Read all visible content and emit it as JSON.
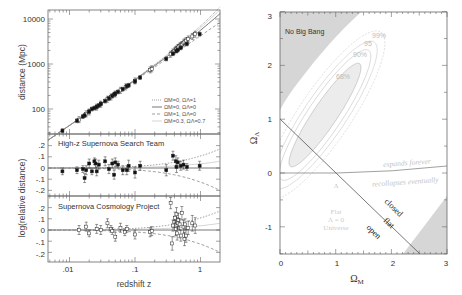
{
  "chart_data": [
    {
      "type": "scatter",
      "title": "Hubble diagram of Type Ia supernovae",
      "xlabel": "redshift z",
      "xscale": "log",
      "xlim": [
        0.0047,
        2.0
      ],
      "x_ticks": [
        ".01",
        ".1",
        "1"
      ],
      "panels": [
        {
          "name": "hubble",
          "ylabel": "distance (Mpc)",
          "yscale": "log",
          "ylim": [
            28,
            16000
          ],
          "y_ticks": [
            "100",
            "1000",
            "10000"
          ],
          "legend": [
            {
              "label": "ΩM=0, ΩΛ=1",
              "style": "dotted"
            },
            {
              "label": "ΩM=0, ΩΛ=0",
              "style": "solid"
            },
            {
              "label": "ΩM=1, ΩΛ=0",
              "style": "dashed"
            },
            {
              "label": "ΩM=0.3, ΩΛ=0.7",
              "style": "thin-solid"
            }
          ],
          "legend_position": "lower right",
          "series": [
            {
              "name": "High-z Supernova Search Team",
              "marker": "filled-square",
              "x": [
                0.0078,
                0.013,
                0.016,
                0.017,
                0.02,
                0.022,
                0.024,
                0.026,
                0.028,
                0.03,
                0.035,
                0.04,
                0.045,
                0.048,
                0.05,
                0.055,
                0.065,
                0.075,
                0.08,
                0.1,
                0.12,
                0.3,
                0.38,
                0.43,
                0.45,
                0.5,
                0.62,
                0.97
              ],
              "y": [
                33,
                55,
                68,
                72,
                88,
                100,
                105,
                112,
                120,
                130,
                150,
                172,
                195,
                210,
                220,
                240,
                275,
                320,
                335,
                410,
                500,
                1300,
                1700,
                1950,
                2050,
                2300,
                2800,
                4600
              ]
            },
            {
              "name": "Supernova Cosmology Project",
              "marker": "open-square",
              "x": [
                0.014,
                0.018,
                0.02,
                0.026,
                0.03,
                0.038,
                0.043,
                0.05,
                0.06,
                0.072,
                0.1,
                0.17,
                0.18,
                0.35,
                0.38,
                0.4,
                0.42,
                0.43,
                0.45,
                0.46,
                0.48,
                0.5,
                0.52,
                0.55,
                0.57,
                0.6,
                0.65,
                0.75,
                0.83
              ],
              "y": [
                58,
                78,
                86,
                110,
                128,
                165,
                185,
                215,
                260,
                310,
                420,
                740,
                780,
                1650,
                1850,
                1950,
                2100,
                2150,
                2300,
                2350,
                2500,
                2600,
                2700,
                2950,
                3100,
                3300,
                3600,
                4100,
                4600
              ]
            }
          ]
        },
        {
          "name": "residual-high-z",
          "panel_label": "High-z Supernova Search Team",
          "ylabel": "log(relative distance)",
          "ylim": [
            -0.25,
            0.25
          ],
          "y_ticks": [
            ".2",
            ".1",
            "0",
            "-.1",
            "-.2"
          ],
          "series": [
            {
              "name": "High-z Supernova Search Team",
              "marker": "filled-square",
              "x": [
                0.0078,
                0.013,
                0.016,
                0.017,
                0.018,
                0.02,
                0.022,
                0.024,
                0.025,
                0.026,
                0.028,
                0.035,
                0.04,
                0.045,
                0.048,
                0.05,
                0.055,
                0.065,
                0.075,
                0.08,
                0.1,
                0.12,
                0.3,
                0.38,
                0.42,
                0.43,
                0.45,
                0.5,
                0.55,
                0.62,
                0.97
              ],
              "y": [
                -0.03,
                -0.02,
                -0.01,
                -0.09,
                -0.02,
                0.04,
                -0.03,
                0.06,
                0.04,
                -0.03,
                0.03,
                0.06,
                -0.01,
                0.04,
                -0.06,
                0.05,
                0.03,
                -0.02,
                -0.02,
                0.02,
                -0.04,
                0.02,
                -0.02,
                0.11,
                0.06,
                0.01,
                0.05,
                0.02,
                0.03,
                0.01,
                0.02
              ],
              "err": [
                0.03,
                0.03,
                0.03,
                0.04,
                0.04,
                0.04,
                0.03,
                0.03,
                0.04,
                0.04,
                0.04,
                0.04,
                0.04,
                0.04,
                0.04,
                0.04,
                0.03,
                0.04,
                0.04,
                0.05,
                0.05,
                0.04,
                0.05,
                0.04,
                0.05,
                0.05,
                0.04,
                0.04,
                0.04,
                0.03,
                0.04
              ]
            }
          ],
          "model_curves": [
            "dotted ΩΛ=1 rises to ~+0.17 at z=2",
            "dashed ΩM=1 falls to ~-0.19 at z=2",
            "solid Ω=0 baseline at 0"
          ]
        },
        {
          "name": "residual-scp",
          "panel_label": "Supernova Cosmology Project",
          "ylabel": "log(relative distance)",
          "ylim": [
            -0.25,
            0.25
          ],
          "y_ticks": [
            ".2",
            ".1",
            "0",
            "-.1",
            "-.2"
          ],
          "series": [
            {
              "name": "Supernova Cosmology Project",
              "marker": "open-square",
              "x": [
                0.014,
                0.018,
                0.02,
                0.026,
                0.03,
                0.038,
                0.043,
                0.045,
                0.05,
                0.06,
                0.07,
                0.075,
                0.1,
                0.17,
                0.18,
                0.35,
                0.37,
                0.38,
                0.4,
                0.41,
                0.42,
                0.43,
                0.44,
                0.45,
                0.46,
                0.48,
                0.5,
                0.52,
                0.55,
                0.57,
                0.58,
                0.6,
                0.65,
                0.75,
                0.83
              ],
              "y": [
                0.0,
                0.03,
                -0.03,
                0.01,
                0.0,
                0.06,
                0.01,
                -0.01,
                -0.06,
                0.02,
                -0.02,
                0.01,
                -0.04,
                -0.02,
                -0.01,
                0.24,
                -0.12,
                0.04,
                0.07,
                0.11,
                0.01,
                0.14,
                -0.03,
                0.06,
                0.09,
                0.05,
                -0.05,
                0.15,
                0.03,
                -0.08,
                0.05,
                -0.05,
                0.02,
                0.06,
                0.04
              ],
              "err": [
                0.04,
                0.04,
                0.03,
                0.04,
                0.04,
                0.04,
                0.03,
                0.03,
                0.04,
                0.04,
                0.03,
                0.03,
                0.04,
                0.04,
                0.04,
                0.05,
                0.06,
                0.05,
                0.05,
                0.05,
                0.06,
                0.06,
                0.06,
                0.05,
                0.06,
                0.05,
                0.05,
                0.06,
                0.06,
                0.06,
                0.05,
                0.06,
                0.06,
                0.07,
                0.07
              ]
            }
          ]
        }
      ]
    },
    {
      "type": "area",
      "title": "Confidence regions in the ΩM–ΩΛ plane",
      "xlabel": "ΩM",
      "ylabel": "ΩΛ",
      "xlim": [
        0,
        3
      ],
      "ylim": [
        -1.5,
        3
      ],
      "x_ticks": [
        "0",
        "1",
        "2",
        "3"
      ],
      "y_ticks": [
        "3",
        "2",
        "1",
        "0",
        "-1"
      ],
      "grid": false,
      "regions": [
        {
          "name": "No Big Bang",
          "label": "No Big Bang",
          "fill": "#d9d9d9",
          "polygon": [
            [
              0,
              1.45
            ],
            [
              0,
              3
            ],
            [
              1.45,
              3
            ]
          ]
        },
        {
          "name": "closed-recollapse shaded",
          "fill": "#d9d9d9",
          "polygon": [
            [
              2.2,
              -1.5
            ],
            [
              3,
              -0.45
            ],
            [
              3,
              -1.5
            ]
          ]
        }
      ],
      "contours": [
        {
          "label": "68%",
          "center": [
            0.75,
            1.05
          ],
          "note": "innermost ellipse, shaded"
        },
        {
          "label": "90%"
        },
        {
          "label": "95%"
        },
        {
          "label": "99%"
        }
      ],
      "lines": [
        {
          "name": "flat universe",
          "label": "flat",
          "points": [
            [
              0,
              1
            ],
            [
              2.5,
              -1.5
            ]
          ]
        },
        {
          "name": "expansion boundary",
          "labels": [
            "expands forever",
            "recollapses eventually"
          ],
          "points": [
            [
              0,
              0
            ],
            [
              1,
              0
            ],
            [
              2,
              0.03
            ],
            [
              3,
              0.12
            ]
          ]
        }
      ],
      "annotations": [
        "closed",
        "flat",
        "open",
        "Λ",
        "Flat",
        "Λ = 0",
        "Universe",
        "No Big Bang",
        "68%",
        "90%",
        "95%",
        "99%"
      ]
    }
  ],
  "left": {
    "ylabel_top": "distance (Mpc)",
    "ylabel_bottom": "log(relative distance)",
    "xlabel": "redshift z",
    "x_ticks": [
      ".01",
      ".1",
      "1"
    ],
    "top_ticks": [
      "10000",
      "1000",
      "100"
    ],
    "resid_ticks": [
      ".2",
      ".1",
      "0",
      "-.1",
      "-.2"
    ],
    "panel2_label": "High-z Supernova Search Team",
    "panel3_label": "Supernova Cosmology Project",
    "legend": [
      "ΩM=0, ΩΛ=1",
      "ΩM=0, ΩΛ=0",
      "ΩM=1, ΩΛ=0",
      "ΩM=0.3, ΩΛ=0.7"
    ]
  },
  "right": {
    "xlabel": "Ω",
    "xlabel_sub": "M",
    "ylabel": "Ω",
    "ylabel_sub": "Λ",
    "x_ticks": [
      "0",
      "1",
      "2",
      "3"
    ],
    "y_ticks": [
      "3",
      "2",
      "1",
      "0",
      "-1"
    ],
    "no_big_bang": "No Big Bang",
    "c99": "99%",
    "c95": "95",
    "c90": "90%",
    "c68": "68%",
    "expands": "expands forever",
    "recollapses": "recollapses eventually",
    "closed": "closed",
    "flat": "flat",
    "open": "open",
    "lambda": "Λ",
    "flat_universe_1": "Flat",
    "flat_universe_2": "Λ = 0",
    "flat_universe_3": "Universe"
  },
  "colors": {
    "axis": "#555555",
    "shade": "#d6d6d6",
    "contour": "#b8b8b8",
    "contour_fill": "#ececec",
    "faint_text": "#c8c8c8",
    "data": "#111111"
  }
}
